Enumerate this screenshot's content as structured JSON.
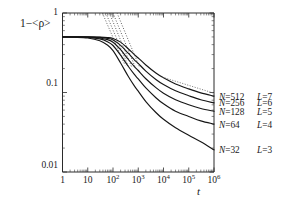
{
  "chart_data": {
    "type": "line",
    "title": "",
    "xlabel": "t",
    "ylabel": "1−<ρ>",
    "xscale": "log",
    "yscale": "log",
    "xlim": [
      1,
      1000000
    ],
    "ylim": [
      0.01,
      1
    ],
    "grid": false,
    "legend_position": "right-outside",
    "xtick_labels": [
      "1",
      "10",
      "10²",
      "10³",
      "10⁴",
      "10⁵",
      "10⁶"
    ],
    "xtick_values": [
      1,
      10,
      100,
      1000,
      10000,
      100000,
      1000000
    ],
    "ytick_labels": [
      "1",
      "0.1",
      "0.01"
    ],
    "ytick_values": [
      1,
      0.1,
      0.01
    ],
    "series": [
      {
        "name": "N=512 L=7",
        "style": "solid",
        "x": [
          1,
          3,
          10,
          30,
          60,
          100,
          200,
          400,
          700,
          1000,
          2000,
          5000,
          10000,
          30000,
          100000,
          300000,
          1000000
        ],
        "y": [
          0.5,
          0.5,
          0.5,
          0.498,
          0.492,
          0.478,
          0.43,
          0.355,
          0.3,
          0.272,
          0.222,
          0.176,
          0.153,
          0.128,
          0.111,
          0.099,
          0.09
        ]
      },
      {
        "name": "N=256 L=6",
        "style": "solid",
        "x": [
          1,
          3,
          10,
          30,
          60,
          100,
          200,
          400,
          700,
          1000,
          2000,
          5000,
          10000,
          30000,
          100000,
          300000,
          1000000
        ],
        "y": [
          0.5,
          0.5,
          0.499,
          0.493,
          0.48,
          0.458,
          0.392,
          0.312,
          0.258,
          0.232,
          0.186,
          0.146,
          0.126,
          0.105,
          0.091,
          0.081,
          0.074
        ]
      },
      {
        "name": "N=128 L=5",
        "style": "solid",
        "x": [
          1,
          3,
          10,
          30,
          60,
          100,
          200,
          400,
          700,
          1000,
          2000,
          5000,
          10000,
          30000,
          100000,
          300000,
          1000000
        ],
        "y": [
          0.5,
          0.499,
          0.497,
          0.485,
          0.462,
          0.428,
          0.345,
          0.262,
          0.212,
          0.189,
          0.149,
          0.115,
          0.098,
          0.081,
          0.07,
          0.063,
          0.058
        ]
      },
      {
        "name": "N=64 L=4",
        "style": "solid",
        "x": [
          1,
          3,
          10,
          30,
          60,
          100,
          200,
          400,
          700,
          1000,
          2000,
          5000,
          10000,
          30000,
          100000,
          300000,
          1000000
        ],
        "y": [
          0.5,
          0.498,
          0.493,
          0.472,
          0.436,
          0.39,
          0.295,
          0.214,
          0.169,
          0.148,
          0.114,
          0.086,
          0.072,
          0.058,
          0.05,
          0.044,
          0.04
        ]
      },
      {
        "name": "N=32 L=3",
        "style": "solid",
        "x": [
          1,
          3,
          10,
          30,
          60,
          100,
          200,
          400,
          700,
          1000,
          2000,
          5000,
          10000,
          30000,
          100000,
          300000,
          1000000
        ],
        "y": [
          0.5,
          0.496,
          0.485,
          0.448,
          0.395,
          0.336,
          0.235,
          0.16,
          0.121,
          0.104,
          0.077,
          0.056,
          0.046,
          0.036,
          0.029,
          0.024,
          0.019
        ]
      }
    ],
    "asymptotes": [
      {
        "name": "asymptote-1",
        "style": "dotted",
        "x": [
          38,
          300
        ],
        "y": [
          1.0,
          0.22
        ]
      },
      {
        "name": "asymptote-2",
        "style": "dotted",
        "x": [
          52,
          400
        ],
        "y": [
          1.0,
          0.215
        ]
      },
      {
        "name": "asymptote-3",
        "style": "dotted",
        "x": [
          72,
          540
        ],
        "y": [
          1.0,
          0.212
        ]
      },
      {
        "name": "asymptote-4",
        "style": "dotted",
        "x": [
          100,
          760
        ],
        "y": [
          1.0,
          0.208
        ]
      },
      {
        "name": "asymptote-5",
        "style": "dotted",
        "x": [
          145,
          1150
        ],
        "y": [
          1.0,
          0.205
        ]
      }
    ],
    "tail_dotted": [
      {
        "name": "tail-dots-512",
        "x": [
          9000,
          1000000
        ],
        "y": [
          0.156,
          0.098
        ]
      }
    ],
    "annotations": []
  },
  "axes": {
    "ylabel": "1−<ρ>",
    "xlabel": "t",
    "yticks": [
      {
        "label": "1",
        "value": 1
      },
      {
        "label": "0.1",
        "value": 0.1
      },
      {
        "label": "0.01",
        "value": 0.01
      }
    ],
    "xticks": [
      {
        "mantissa": "1",
        "exponent": "",
        "value": 1
      },
      {
        "mantissa": "10",
        "exponent": "",
        "value": 10
      },
      {
        "mantissa": "10",
        "exponent": "2",
        "value": 100
      },
      {
        "mantissa": "10",
        "exponent": "3",
        "value": 1000
      },
      {
        "mantissa": "10",
        "exponent": "4",
        "value": 10000
      },
      {
        "mantissa": "10",
        "exponent": "5",
        "value": 100000
      },
      {
        "mantissa": "10",
        "exponent": "6",
        "value": 1000000
      }
    ]
  },
  "legend": {
    "entries": [
      {
        "n_label": "N=512",
        "l_label": "L=7"
      },
      {
        "n_label": "N=256",
        "l_label": "L=6"
      },
      {
        "n_label": "N=128",
        "l_label": "L=5"
      },
      {
        "n_label": "N=64",
        "l_label": "L=4"
      },
      {
        "n_label": "N=32",
        "l_label": "L=3"
      }
    ]
  },
  "colors": {
    "curve": "#161616",
    "asymptote": "#555555",
    "axis": "#2b2b2b",
    "background": "#ffffff"
  }
}
